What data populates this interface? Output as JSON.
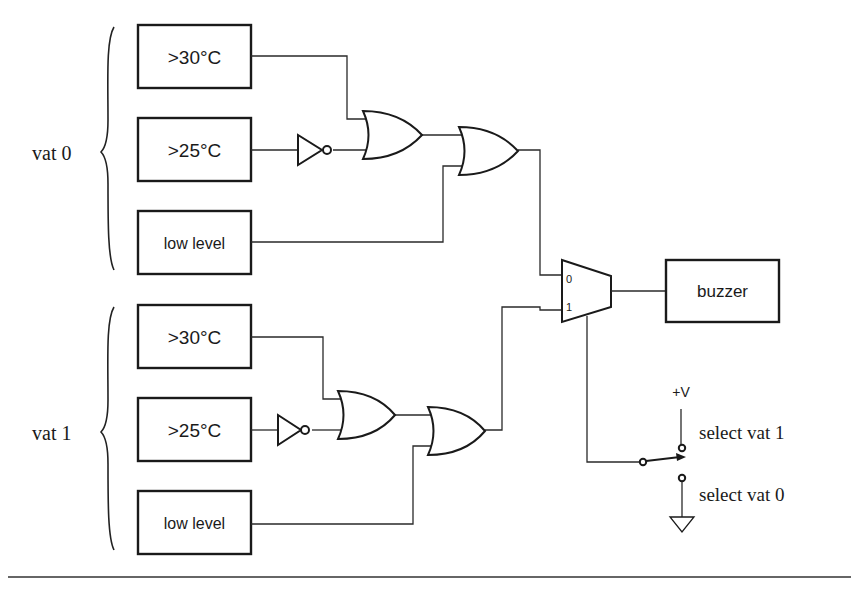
{
  "diagram": {
    "type": "logic circuit",
    "groups": [
      {
        "label": "vat 0",
        "sensors": [
          ">30°C",
          ">25°C",
          "low level"
        ]
      },
      {
        "label": "vat 1",
        "sensors": [
          ">30°C",
          ">25°C",
          "low level"
        ]
      }
    ],
    "mux": {
      "input0": "0",
      "input1": "1"
    },
    "output": "buzzer",
    "switch": {
      "supply": "+V",
      "top_label": "select vat 1",
      "bottom_label": "select vat 0"
    }
  }
}
